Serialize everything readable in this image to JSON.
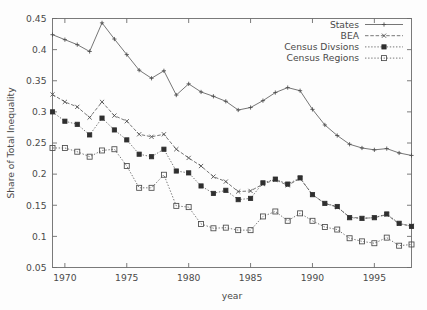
{
  "chart_data": {
    "type": "line",
    "title": "",
    "xlabel": "year",
    "ylabel": "Share of Total Inequality",
    "xlim": [
      1969,
      1998
    ],
    "ylim": [
      0.05,
      0.45
    ],
    "xticks": [
      1970,
      1975,
      1980,
      1985,
      1990,
      1995
    ],
    "xtick_labels": [
      "1970",
      "1975",
      "1980",
      "1985",
      "1990",
      "1995"
    ],
    "yticks": [
      0.05,
      0.1,
      0.15,
      0.2,
      0.25,
      0.3,
      0.35,
      0.4,
      0.45
    ],
    "ytick_labels": [
      "0.05",
      "0.1",
      "0.15",
      "0.2",
      "0.25",
      "0.3",
      "0.35",
      "0.4",
      "0.45"
    ],
    "grid": false,
    "legend_position": "top-right",
    "x": [
      1969,
      1970,
      1971,
      1972,
      1973,
      1974,
      1975,
      1976,
      1977,
      1978,
      1979,
      1980,
      1981,
      1982,
      1983,
      1984,
      1985,
      1986,
      1987,
      1988,
      1989,
      1990,
      1991,
      1992,
      1993,
      1994,
      1995,
      1996,
      1997,
      1998
    ],
    "series": [
      {
        "name": "States",
        "marker": "plus",
        "linestyle": "solid",
        "values": [
          0.424,
          0.416,
          0.408,
          0.397,
          0.443,
          0.417,
          0.392,
          0.367,
          0.354,
          0.366,
          0.327,
          0.345,
          0.332,
          0.325,
          0.317,
          0.303,
          0.307,
          0.318,
          0.331,
          0.339,
          0.334,
          0.304,
          0.279,
          0.262,
          0.248,
          0.242,
          0.239,
          0.241,
          0.234,
          0.23
        ]
      },
      {
        "name": "BEA",
        "marker": "cross",
        "linestyle": "dashed",
        "values": [
          0.328,
          0.316,
          0.308,
          0.291,
          0.316,
          0.294,
          0.285,
          0.264,
          0.26,
          0.264,
          0.24,
          0.226,
          0.213,
          0.196,
          0.188,
          0.172,
          0.173,
          0.184,
          0.191,
          0.182,
          0.193,
          0.167,
          0.153,
          0.147,
          0.131,
          0.129,
          0.13,
          0.135,
          0.12,
          0.117
        ]
      },
      {
        "name": "Census Divsions",
        "marker": "filled-square",
        "linestyle": "dotted",
        "values": [
          0.3,
          0.285,
          0.28,
          0.263,
          0.29,
          0.271,
          0.255,
          0.232,
          0.228,
          0.24,
          0.205,
          0.202,
          0.181,
          0.169,
          0.174,
          0.159,
          0.161,
          0.186,
          0.192,
          0.184,
          0.194,
          0.167,
          0.153,
          0.148,
          0.13,
          0.129,
          0.13,
          0.136,
          0.121,
          0.116
        ]
      },
      {
        "name": "Census Regions",
        "marker": "open-square",
        "linestyle": "dotted",
        "values": [
          0.242,
          0.242,
          0.236,
          0.228,
          0.238,
          0.24,
          0.213,
          0.178,
          0.178,
          0.199,
          0.149,
          0.147,
          0.12,
          0.113,
          0.114,
          0.11,
          0.11,
          0.132,
          0.14,
          0.125,
          0.137,
          0.125,
          0.115,
          0.111,
          0.097,
          0.092,
          0.089,
          0.098,
          0.085,
          0.087
        ]
      }
    ]
  },
  "legend": {
    "entries": [
      {
        "label": "States"
      },
      {
        "label": "BEA"
      },
      {
        "label": "Census Divsions"
      },
      {
        "label": "Census Regions"
      }
    ]
  }
}
